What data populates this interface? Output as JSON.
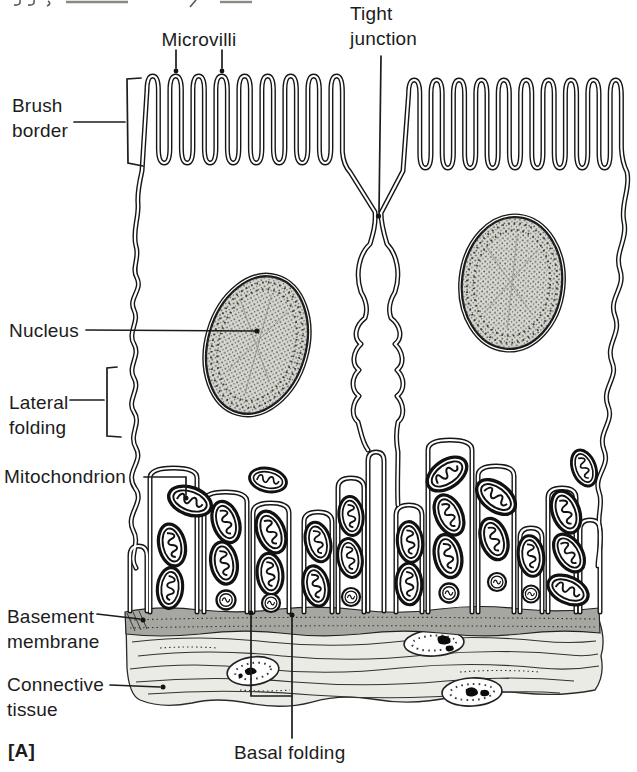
{
  "figure": {
    "panel_marker": "[A]",
    "labels": {
      "microvilli": "Microvilli",
      "tight_junction": "Tight\njunction",
      "brush_border": "Brush\nborder",
      "nucleus": "Nucleus",
      "lateral_folding": "Lateral\nfolding",
      "mitochondrion": "Mitochondrion",
      "basement_membrane": "Basement\nmembrane",
      "connective_tissue": "Connective\ntissue",
      "basal_folding": "Basal folding"
    },
    "colors": {
      "background": "#ffffff",
      "ink": "#1c1c1c",
      "nucleus_fill": "#d8d8d2",
      "basement_membrane_fill": "#a7a7a1",
      "connective_tissue_fill": "#ebebe6"
    }
  }
}
